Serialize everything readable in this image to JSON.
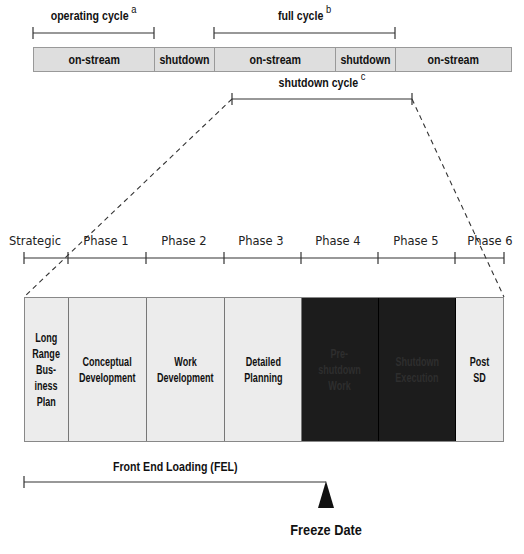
{
  "top_timeline": {
    "brackets": {
      "operating_cycle": {
        "label": "operating cycle",
        "note": "a"
      },
      "full_cycle": {
        "label": "full cycle",
        "note": "b"
      },
      "shutdown_cycle": {
        "label": "shutdown cycle",
        "note": "c"
      }
    },
    "segments": [
      {
        "label": "on-stream",
        "width": 121
      },
      {
        "label": "shutdown",
        "width": 60
      },
      {
        "label": "on-stream",
        "width": 121
      },
      {
        "label": "shutdown",
        "width": 60
      },
      {
        "label": "on-stream",
        "width": 117
      }
    ]
  },
  "phase_axis": {
    "labels": [
      {
        "label": "Strategic",
        "x": 35
      },
      {
        "label": "Phase 1",
        "x": 106
      },
      {
        "label": "Phase 2",
        "x": 184
      },
      {
        "label": "Phase 3",
        "x": 261
      },
      {
        "label": "Phase 4",
        "x": 338
      },
      {
        "label": "Phase 5",
        "x": 416
      },
      {
        "label": "Phase 6",
        "x": 490
      }
    ]
  },
  "phase_boxes": [
    {
      "label": "Long Range Bus- iness Plan",
      "lines": [
        "Long",
        "Range",
        "Bus-",
        "iness",
        "Plan"
      ],
      "width": 44,
      "style": "light"
    },
    {
      "label": "Conceptual Development",
      "lines": [
        "Conceptual",
        "Development"
      ],
      "width": 78,
      "style": "light"
    },
    {
      "label": "Work Development",
      "lines": [
        "Work",
        "Development"
      ],
      "width": 78,
      "style": "light"
    },
    {
      "label": "Detailed Planning",
      "lines": [
        "Detailed",
        "Planning"
      ],
      "width": 77,
      "style": "light"
    },
    {
      "label": "Pre- shutdown Work",
      "lines": [
        "Pre-",
        "shutdown",
        "Work"
      ],
      "width": 77,
      "style": "dark"
    },
    {
      "label": "Shutdown Execution",
      "lines": [
        "Shutdown",
        "Execution"
      ],
      "width": 77,
      "style": "dark"
    },
    {
      "label": "Post SD",
      "lines": [
        "Post SD"
      ],
      "width": 49,
      "style": "light"
    }
  ],
  "fel": {
    "label": "Front End Loading (FEL)"
  },
  "milestone": {
    "label": "Freeze Date"
  },
  "colors": {
    "bar_fill": "#dedede",
    "box_fill": "#ececec",
    "dark_fill": "#1c1c1c",
    "line": "#333333"
  }
}
